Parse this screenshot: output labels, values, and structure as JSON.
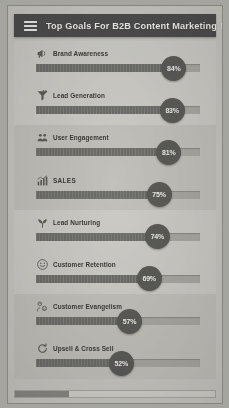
{
  "header": {
    "title": "Top Goals For B2B Content Marketing !",
    "menu_icon": "hamburger-menu-icon"
  },
  "goals": [
    {
      "label": "Brand Awareness",
      "percent": "84%",
      "value": 84,
      "icon": "megaphone-icon"
    },
    {
      "label": "Lead Generation",
      "percent": "83%",
      "value": 83,
      "icon": "funnel-icon"
    },
    {
      "label": "User Engagement",
      "percent": "81%",
      "value": 81,
      "icon": "people-icon"
    },
    {
      "label": "SALES",
      "percent": "75%",
      "value": 75,
      "icon": "bar-chart-up-icon"
    },
    {
      "label": "Lead Nurturing",
      "percent": "74%",
      "value": 74,
      "icon": "sprout-icon"
    },
    {
      "label": "Customer Retention",
      "percent": "69%",
      "value": 69,
      "icon": "smiley-face-icon"
    },
    {
      "label": "Customer Evangelism",
      "percent": "57%",
      "value": 57,
      "icon": "two-people-speech-icon"
    },
    {
      "label": "Upsell & Cross Sell",
      "percent": "52%",
      "value": 52,
      "icon": "refresh-cycle-icon"
    }
  ],
  "scrollbar": {
    "name": "horizontal-scrollbar",
    "thumb_percent": 27
  },
  "chart_data": {
    "type": "bar",
    "title": "Top Goals For B2B Content Marketing !",
    "xlabel": "",
    "ylabel": "",
    "categories": [
      "Brand Awareness",
      "Lead Generation",
      "User Engagement",
      "SALES",
      "Lead Nurturing",
      "Customer Retention",
      "Customer Evangelism",
      "Upsell & Cross Sell"
    ],
    "values": [
      84,
      83,
      81,
      75,
      74,
      69,
      57,
      52
    ],
    "value_labels": [
      "84%",
      "83%",
      "81%",
      "75%",
      "74%",
      "69%",
      "57%",
      "52%"
    ],
    "xlim": [
      0,
      100
    ],
    "orientation": "horizontal",
    "grid": false,
    "legend": "none"
  },
  "colors": {
    "appbar_bg": "#4d4d4d",
    "appbar_text": "#f2f1ee",
    "page_bg": "#c9c8c3",
    "row_alt_bg": "#c2c1bb",
    "track_bg": "#a9a8a2",
    "fill": "#6d6d6a",
    "badge_bg": "#5b5b58",
    "badge_text": "#efeeea"
  }
}
